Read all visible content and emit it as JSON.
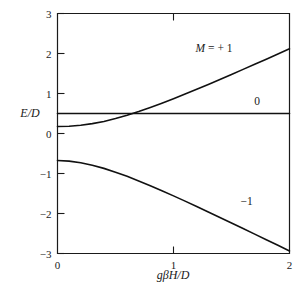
{
  "chart_data": {
    "type": "line",
    "title": "",
    "xlabel": "gβH/D",
    "ylabel": "E/D",
    "xlim": [
      0,
      2
    ],
    "ylim": [
      -3,
      3
    ],
    "xticks": [
      "0",
      "1",
      "2"
    ],
    "xtick_values": [
      0,
      1,
      2
    ],
    "yticks": [
      "3",
      "2",
      "1",
      "0",
      "-1",
      "-2",
      "-3"
    ],
    "ytick_values": [
      3,
      2,
      1,
      0,
      -1,
      -2,
      -3
    ],
    "grid": false,
    "legend_position": "inline-labels",
    "series": [
      {
        "name": "M = + 1",
        "label": "M = + 1",
        "label_x": 1.35,
        "label_y": 2.05,
        "x": [
          0.0,
          0.1,
          0.2,
          0.3,
          0.4,
          0.5,
          0.6,
          0.7,
          0.8,
          0.9,
          1.0,
          1.1,
          1.2,
          1.3,
          1.4,
          1.5,
          1.6,
          1.7,
          1.8,
          1.9,
          2.0
        ],
        "y": [
          0.175,
          0.182,
          0.205,
          0.246,
          0.302,
          0.373,
          0.456,
          0.549,
          0.65,
          0.757,
          0.87,
          0.986,
          1.105,
          1.227,
          1.351,
          1.476,
          1.603,
          1.73,
          1.858,
          1.987,
          2.117
        ]
      },
      {
        "name": "0",
        "label": "0",
        "label_x": 1.72,
        "label_y": 0.72,
        "x": [
          0.0,
          2.0
        ],
        "y": [
          0.5,
          0.5
        ]
      },
      {
        "name": "-1",
        "label": "-1",
        "label_x": 1.63,
        "label_y": -1.78,
        "x": [
          0.0,
          0.1,
          0.2,
          0.3,
          0.4,
          0.5,
          0.6,
          0.7,
          0.8,
          0.9,
          1.0,
          1.1,
          1.2,
          1.3,
          1.4,
          1.5,
          1.6,
          1.7,
          1.8,
          1.9,
          2.0
        ],
        "y": [
          -0.675,
          -0.69,
          -0.73,
          -0.792,
          -0.872,
          -0.966,
          -1.071,
          -1.185,
          -1.305,
          -1.43,
          -1.559,
          -1.691,
          -1.825,
          -1.961,
          -2.098,
          -2.236,
          -2.375,
          -2.515,
          -2.655,
          -2.795,
          -2.936
        ]
      }
    ]
  },
  "labels": {
    "y_axis": "E/D",
    "x_axis": "gβH/D"
  }
}
